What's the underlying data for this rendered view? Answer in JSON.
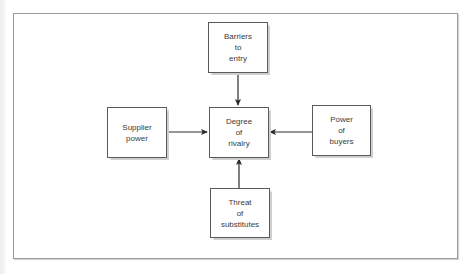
{
  "diagram": {
    "type": "flow",
    "title": "",
    "nodes": [
      {
        "id": "barriers",
        "lines": [
          "Barriers",
          "to",
          "entry"
        ]
      },
      {
        "id": "supplier",
        "lines": [
          "Supplier",
          "power"
        ]
      },
      {
        "id": "rivalry",
        "lines": [
          "Degree",
          "of",
          "rivalry"
        ]
      },
      {
        "id": "buyers",
        "lines": [
          "Power",
          "of",
          "buyers"
        ]
      },
      {
        "id": "substitutes",
        "lines": [
          "Threat",
          "of",
          "substitutes"
        ]
      }
    ],
    "edges": [
      {
        "from": "barriers",
        "to": "rivalry"
      },
      {
        "from": "supplier",
        "to": "rivalry"
      },
      {
        "from": "buyers",
        "to": "rivalry"
      },
      {
        "from": "substitutes",
        "to": "rivalry"
      }
    ],
    "colors": {
      "line": "#2a2a2a",
      "border": "#5a5a5a",
      "text": "#3a3a3a"
    }
  }
}
